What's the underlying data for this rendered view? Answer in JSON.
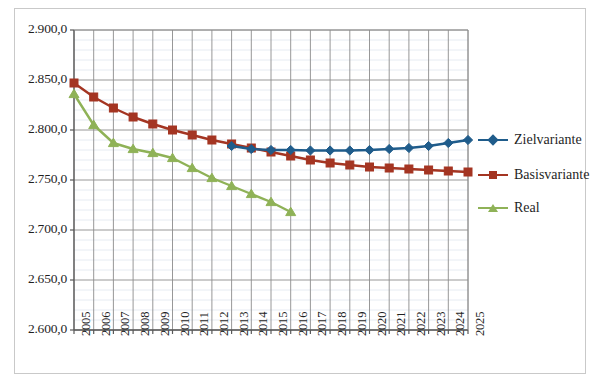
{
  "chart_data": {
    "type": "line",
    "title": "",
    "xlabel": "",
    "ylabel": "",
    "x": [
      2005,
      2006,
      2007,
      2008,
      2009,
      2010,
      2011,
      2012,
      2013,
      2014,
      2015,
      2016,
      2017,
      2018,
      2019,
      2020,
      2021,
      2022,
      2023,
      2024,
      2025
    ],
    "categories": [
      "2005",
      "2006",
      "2007",
      "2008",
      "2009",
      "2010",
      "2011",
      "2012",
      "2013",
      "2014",
      "2015",
      "2016",
      "2017",
      "2018",
      "2019",
      "2020",
      "2021",
      "2022",
      "2023",
      "2024",
      "2025"
    ],
    "ylim": [
      2600,
      2900
    ],
    "ytick_values": [
      2600,
      2650,
      2700,
      2750,
      2800,
      2850,
      2900
    ],
    "ytick_labels": [
      "2.600,0",
      "2.650,0",
      "2.700,0",
      "2.750,0",
      "2.800,0",
      "2.850,0",
      "2.900,0"
    ],
    "y_major_step": 50,
    "y_minor_step": 10,
    "grid": true,
    "grid_minor": true,
    "legend_position": "right",
    "series": [
      {
        "name": "Zielvariante",
        "color": "#1f5c8b",
        "marker": "diamond",
        "x": [
          2013,
          2014,
          2015,
          2016,
          2017,
          2018,
          2019,
          2020,
          2021,
          2022,
          2023,
          2024,
          2025
        ],
        "values": [
          2784.0,
          2781.0,
          2780.0,
          2780.0,
          2779.5,
          2779.5,
          2779.5,
          2780.0,
          2781.0,
          2782.0,
          2784.0,
          2787.0,
          2790.0
        ]
      },
      {
        "name": "Basisvariante",
        "color": "#a43522",
        "marker": "square",
        "x": [
          2005,
          2006,
          2007,
          2008,
          2009,
          2010,
          2011,
          2012,
          2013,
          2014,
          2015,
          2016,
          2017,
          2018,
          2019,
          2020,
          2021,
          2022,
          2023,
          2024,
          2025
        ],
        "values": [
          2847.0,
          2833.0,
          2822.0,
          2813.0,
          2806.0,
          2800.0,
          2795.0,
          2790.0,
          2786.0,
          2782.0,
          2778.0,
          2774.0,
          2770.0,
          2767.0,
          2765.0,
          2763.0,
          2762.0,
          2761.0,
          2760.0,
          2759.0,
          2758.0
        ]
      },
      {
        "name": "Real",
        "color": "#8fb257",
        "marker": "triangle",
        "x": [
          2005,
          2006,
          2007,
          2008,
          2009,
          2010,
          2011,
          2012,
          2013,
          2014,
          2015,
          2016
        ],
        "values": [
          2836.0,
          2805.0,
          2787.0,
          2781.0,
          2777.0,
          2772.0,
          2762.0,
          2752.0,
          2744.0,
          2736.0,
          2728.0,
          2718.0
        ]
      }
    ]
  },
  "legend": {
    "items": [
      {
        "label": "Zielvariante"
      },
      {
        "label": "Basisvariante"
      },
      {
        "label": "Real"
      }
    ]
  }
}
